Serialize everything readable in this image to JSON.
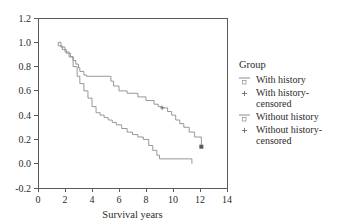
{
  "chart_data": {
    "type": "line",
    "title": "",
    "xlabel": "Survival years",
    "ylabel": "",
    "xlim": [
      0,
      14
    ],
    "ylim": [
      -0.2,
      1.2
    ],
    "xticks": [
      0,
      2,
      4,
      6,
      8,
      10,
      12,
      14
    ],
    "xtick_labels": [
      "0",
      "2",
      "4",
      "6",
      "8",
      "10",
      "12",
      "14"
    ],
    "yticks": [
      -0.2,
      0.0,
      0.2,
      0.4,
      0.6,
      0.8,
      1.0,
      1.2
    ],
    "ytick_labels": [
      "-0.2",
      "0.0",
      "0.2",
      "0.4",
      "0.6",
      "0.8",
      "1.0",
      "1.2"
    ],
    "grid": false,
    "legend_position": "right",
    "series": [
      {
        "name": "With history",
        "step": true,
        "color": "#8c8c8c",
        "x": [
          1.5,
          1.5,
          1.8,
          2.1,
          2.4,
          2.6,
          2.8,
          3.0,
          3.1,
          3.4,
          3.6,
          3.9,
          4.3,
          5.2,
          5.4,
          5.6,
          6.0,
          6.6,
          7.4,
          8.0,
          8.6,
          8.9,
          9.2,
          9.6,
          9.9,
          10.2,
          10.5,
          10.8,
          11.2,
          11.6,
          12.1
        ],
        "y": [
          1.0,
          0.97,
          0.94,
          0.91,
          0.88,
          0.85,
          0.82,
          0.79,
          0.76,
          0.73,
          0.72,
          0.72,
          0.72,
          0.72,
          0.68,
          0.64,
          0.6,
          0.58,
          0.55,
          0.52,
          0.49,
          0.47,
          0.46,
          0.43,
          0.4,
          0.36,
          0.33,
          0.3,
          0.26,
          0.22,
          0.14
        ],
        "censored_points": [
          {
            "x": 9.2,
            "y": 0.46
          },
          {
            "x": 12.1,
            "y": 0.14
          }
        ]
      },
      {
        "name": "Without history",
        "step": true,
        "color": "#8c8c8c",
        "x": [
          1.5,
          1.7,
          2.0,
          2.3,
          2.6,
          2.9,
          3.1,
          3.4,
          3.7,
          4.0,
          4.3,
          4.6,
          4.9,
          5.2,
          5.5,
          5.8,
          6.2,
          6.6,
          7.0,
          7.4,
          7.8,
          8.2,
          8.5,
          8.8,
          9.0,
          11.4
        ],
        "y": [
          1.0,
          0.96,
          0.92,
          0.88,
          0.8,
          0.72,
          0.66,
          0.6,
          0.54,
          0.47,
          0.42,
          0.4,
          0.38,
          0.36,
          0.34,
          0.32,
          0.29,
          0.26,
          0.24,
          0.22,
          0.2,
          0.15,
          0.11,
          0.07,
          0.04,
          0.0
        ],
        "censored_points": []
      }
    ]
  },
  "legend": {
    "title": "Group",
    "entries": [
      {
        "label": "With history",
        "symbol": "line-square"
      },
      {
        "label": "With history-censored",
        "symbol": "plus"
      },
      {
        "label": "Without history",
        "symbol": "line-square"
      },
      {
        "label": "Without history-censored",
        "symbol": "plus"
      }
    ]
  }
}
